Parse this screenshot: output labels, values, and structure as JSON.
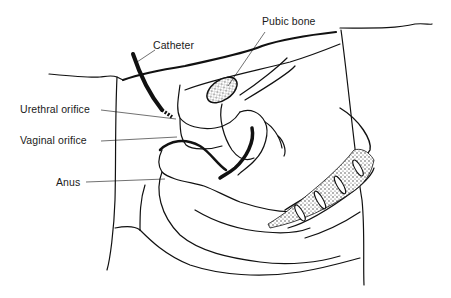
{
  "figure": {
    "labels": {
      "catheter": "Catheter",
      "pubic_bone": "Pubic bone",
      "urethral_orifice": "Urethral orifice",
      "vaginal_orifice": "Vaginal orifice",
      "anus": "Anus"
    },
    "colors": {
      "ink": "#111111",
      "background": "#ffffff",
      "stipple": "#555555"
    }
  }
}
